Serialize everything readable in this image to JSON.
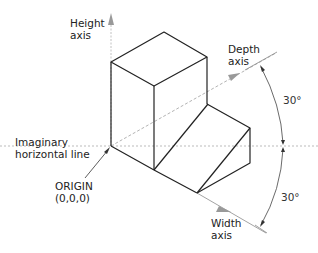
{
  "diagram": {
    "labels": {
      "height_axis_1": "Height",
      "height_axis_2": "axis",
      "depth_axis_1": "Depth",
      "depth_axis_2": "axis",
      "width_axis_1": "Width",
      "width_axis_2": "axis",
      "horizontal_1": "Imaginary",
      "horizontal_2": "horizontal line",
      "origin_1": "ORIGIN",
      "origin_2": "(0,0,0)",
      "angle_top": "30°",
      "angle_bottom": "30°"
    },
    "colors": {
      "object_stroke": "#222222",
      "axis_stroke": "#a8a8a8",
      "arrow_fill": "#999999"
    }
  }
}
